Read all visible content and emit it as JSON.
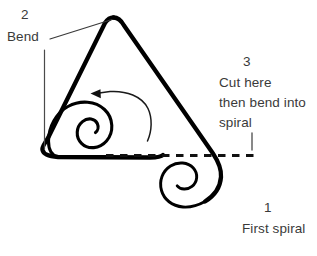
{
  "figure": {
    "background_color": "#ffffff",
    "stroke_color": "#000000",
    "text_color": "#3a3a3a",
    "dash_color": "#1a1a1a"
  },
  "annotations": {
    "bend": {
      "number": "2",
      "label": "Bend"
    },
    "cut": {
      "number": "3",
      "line1": "Cut here",
      "line2": "then bend into",
      "line3": "spiral"
    },
    "first_spiral": {
      "number": "1",
      "label": "First spiral"
    }
  },
  "shapes": {
    "wire_outline_name": "bent-wire-path",
    "inner_spiral_name": "inner-spiral-path",
    "outer_spiral_name": "first-spiral-path",
    "cut_line_name": "dashed-cut-line",
    "rotation_arrow_name": "counterclockwise-arrow",
    "bend_leader_name": "bend-leader-line",
    "bend_tick_name": "bend-tick-line",
    "cut_tick_name": "cut-tick-line"
  }
}
